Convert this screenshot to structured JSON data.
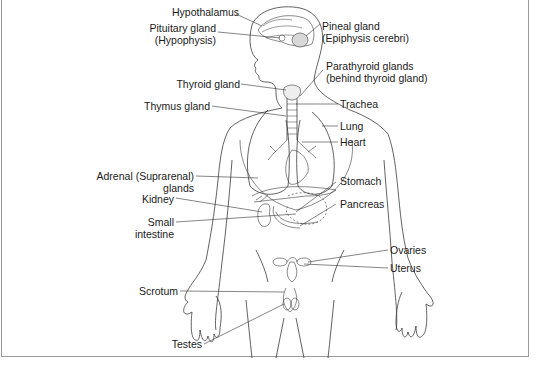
{
  "diagram": {
    "labels_left": [
      {
        "id": "hypothalamus",
        "text": "Hypothalamus"
      },
      {
        "id": "pituitary",
        "line1": "Pituitary gland",
        "line2": "(Hypophysis)"
      },
      {
        "id": "thyroid",
        "text": "Thyroid gland"
      },
      {
        "id": "thymus",
        "text": "Thymus gland"
      },
      {
        "id": "adrenal",
        "line1": "Adrenal (Suprarenal)",
        "line2": "glands"
      },
      {
        "id": "kidney",
        "text": "Kidney"
      },
      {
        "id": "small-intestine",
        "line1": "Small",
        "line2": "intestine"
      },
      {
        "id": "scrotum",
        "text": "Scrotum"
      },
      {
        "id": "testes",
        "text": "Testes"
      }
    ],
    "labels_right": [
      {
        "id": "pineal",
        "line1": "Pineal gland",
        "line2": "(Epiphysis cerebri)"
      },
      {
        "id": "parathyroid",
        "line1": "Parathyroid glands",
        "line2": "(behind thyroid gland)"
      },
      {
        "id": "trachea",
        "text": "Trachea"
      },
      {
        "id": "lung",
        "text": "Lung"
      },
      {
        "id": "heart",
        "text": "Heart"
      },
      {
        "id": "stomach",
        "text": "Stomach"
      },
      {
        "id": "pancreas",
        "text": "Pancreas"
      },
      {
        "id": "ovaries",
        "text": "Ovaries"
      },
      {
        "id": "uterus",
        "text": "Uterus"
      }
    ],
    "colors": {
      "line": "#3a3a3a",
      "text": "#1a1a1a",
      "frame": "#9a9a9a"
    }
  }
}
